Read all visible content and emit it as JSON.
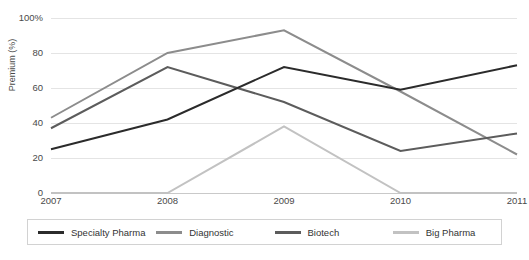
{
  "chart_data": {
    "type": "line",
    "title": "",
    "subtitle": "",
    "xlabel": "",
    "ylabel": "Premium (%)",
    "categories": [
      "2007",
      "2008",
      "2009",
      "2010",
      "2011"
    ],
    "x": [
      2007,
      2008,
      2009,
      2010,
      2011
    ],
    "ylim": [
      0,
      100
    ],
    "xlim": [
      2007,
      2011
    ],
    "grid": true,
    "legend_position": "bottom",
    "y_ticks": [
      {
        "value": 100,
        "label": "100%"
      },
      {
        "value": 80,
        "label": "80"
      },
      {
        "value": 60,
        "label": "60"
      },
      {
        "value": 40,
        "label": "40"
      },
      {
        "value": 20,
        "label": "20"
      },
      {
        "value": 0,
        "label": "0"
      }
    ],
    "series": [
      {
        "name": "Specialty Pharma",
        "color": "#2b2b2b",
        "values": [
          25,
          42,
          72,
          59,
          73
        ]
      },
      {
        "name": "Diagnostic",
        "color": "#8c8c8c",
        "values": [
          43,
          80,
          93,
          58,
          22
        ]
      },
      {
        "name": "Biotech",
        "color": "#5c5c5c",
        "values": [
          37,
          72,
          52,
          24,
          34
        ]
      },
      {
        "name": "Big Pharma",
        "color": "#c2c2c2",
        "values": [
          0,
          0,
          38,
          0,
          0
        ]
      }
    ]
  },
  "legend": {
    "items": [
      {
        "label": "Specialty Pharma",
        "color": "#2b2b2b"
      },
      {
        "label": "Diagnostic",
        "color": "#8c8c8c"
      },
      {
        "label": "Biotech",
        "color": "#5c5c5c"
      },
      {
        "label": "Big Pharma",
        "color": "#c2c2c2"
      }
    ]
  },
  "colors": {
    "background": "#ffffff",
    "gridline": "#e4e4e4",
    "axis": "#c9c9c9",
    "text": "#4a4a4a",
    "legend_border": "#d2d2d2"
  }
}
